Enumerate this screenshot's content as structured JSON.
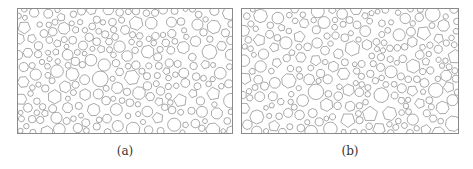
{
  "figure": {
    "panels": [
      {
        "id": "a",
        "caption": "(a)",
        "description": "Random packing of polygonal and circular particles",
        "seed": 17,
        "stroke": "#6f6f6f"
      },
      {
        "id": "b",
        "caption": "(b)",
        "description": "Random packing of polygonal and circular particles (denser)",
        "seed": 91,
        "stroke": "#6f6f6f"
      }
    ]
  }
}
